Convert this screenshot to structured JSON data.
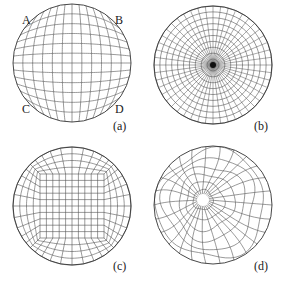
{
  "panels": [
    {
      "id": "a",
      "caption": "(a)",
      "type": "mapped-grid",
      "corner_labels": [
        "A",
        "B",
        "C",
        "D"
      ],
      "center": [
        72,
        63
      ],
      "radius": 59,
      "divisions": 12
    },
    {
      "id": "b",
      "caption": "(b)",
      "type": "polar-grid",
      "center": [
        213,
        65
      ],
      "radius": 59,
      "rings": 10,
      "spokes": 48
    },
    {
      "id": "c",
      "caption": "(c)",
      "type": "o-grid",
      "center": [
        72,
        206
      ],
      "radius": 59,
      "core_divisions": 10,
      "layers": 4
    },
    {
      "id": "d",
      "caption": "(d)",
      "type": "unstructured-quad",
      "center": [
        213,
        205
      ],
      "radius": 59
    }
  ],
  "style": {
    "line_color": "#555555",
    "outline_color": "#333333",
    "background": "#ffffff"
  }
}
